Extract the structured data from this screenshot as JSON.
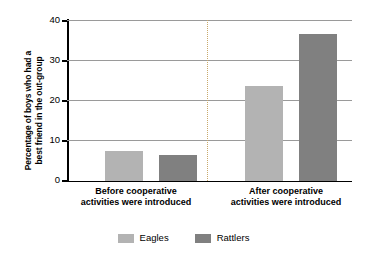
{
  "chart_data": {
    "type": "bar",
    "title": "",
    "xlabel": "",
    "ylabel": "Percentage of boys who had a\nbest friend in the out-group",
    "ylim": [
      0,
      40
    ],
    "yticks": [
      0,
      10,
      20,
      30,
      40
    ],
    "ytick_labels": [
      "0",
      "10",
      "20",
      "30",
      "40"
    ],
    "grid": true,
    "legend_position": "bottom",
    "categories": [
      "Before cooperative\nactivities were introduced",
      "After cooperative\nactivities were introduced"
    ],
    "series": [
      {
        "name": "Eagles",
        "color": "#b3b3b3",
        "values": [
          7.5,
          23.5
        ]
      },
      {
        "name": "Rattlers",
        "color": "#808080",
        "values": [
          6.5,
          36.5
        ]
      }
    ],
    "group_divider": true,
    "divider_color": "#c9a96a"
  },
  "axis": {
    "tick_0": "0",
    "tick_10": "10",
    "tick_20": "20",
    "tick_30": "30",
    "tick_40": "40"
  },
  "categories": {
    "before": "Before cooperative\nactivities were introduced",
    "after": "After cooperative\nactivities were introduced"
  },
  "legend": {
    "eagles": "Eagles",
    "rattlers": "Rattlers"
  }
}
